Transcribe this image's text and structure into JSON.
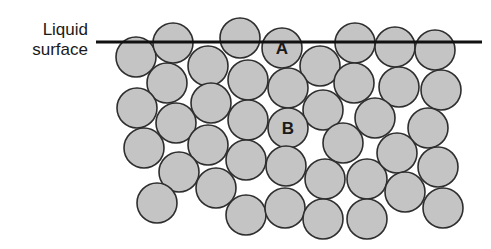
{
  "diagram": {
    "title_lines": [
      "Liquid",
      "surface"
    ],
    "surface_line": {
      "x1": 96,
      "x2": 482,
      "y": 42,
      "stroke_width": 3
    },
    "molecule_radius": 20,
    "colors": {
      "molecule_fill": "#c4c4c4",
      "molecule_stroke": "#2e2e2e",
      "surface_line": "#111111",
      "label_text": "#1a1a1a",
      "background": "#ffffff"
    },
    "labeled_molecules": [
      {
        "label": "A",
        "x": 282,
        "y": 48,
        "description": "molecule at liquid surface"
      },
      {
        "label": "B",
        "x": 288,
        "y": 128,
        "description": "molecule in bulk liquid"
      }
    ],
    "molecules": [
      [
        136,
        57
      ],
      [
        173,
        43
      ],
      [
        208,
        66
      ],
      [
        240,
        38
      ],
      [
        282,
        48
      ],
      [
        320,
        66
      ],
      [
        355,
        43
      ],
      [
        395,
        47
      ],
      [
        435,
        50
      ],
      [
        167,
        83
      ],
      [
        211,
        103
      ],
      [
        248,
        80
      ],
      [
        288,
        88
      ],
      [
        323,
        110
      ],
      [
        354,
        83
      ],
      [
        399,
        87
      ],
      [
        441,
        90
      ],
      [
        137,
        108
      ],
      [
        176,
        123
      ],
      [
        248,
        120
      ],
      [
        288,
        128
      ],
      [
        343,
        143
      ],
      [
        375,
        118
      ],
      [
        428,
        128
      ],
      [
        144,
        148
      ],
      [
        208,
        145
      ],
      [
        246,
        160
      ],
      [
        286,
        166
      ],
      [
        325,
        179
      ],
      [
        367,
        179
      ],
      [
        397,
        153
      ],
      [
        438,
        167
      ],
      [
        179,
        172
      ],
      [
        216,
        188
      ],
      [
        157,
        203
      ],
      [
        246,
        215
      ],
      [
        285,
        208
      ],
      [
        323,
        219
      ],
      [
        367,
        219
      ],
      [
        405,
        192
      ],
      [
        443,
        208
      ]
    ]
  }
}
